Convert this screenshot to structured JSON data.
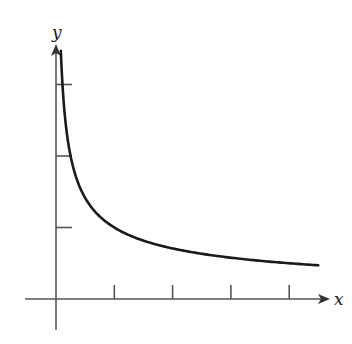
{
  "chart_data": {
    "type": "line",
    "title": "",
    "xlabel": "x",
    "ylabel": "y",
    "function": "y = 1/sqrt(x)",
    "series": [
      {
        "name": "curve",
        "x": [
          0.083,
          0.1,
          0.15,
          0.2,
          0.3,
          0.4,
          0.5,
          0.75,
          1,
          1.5,
          2,
          2.5,
          3,
          3.5,
          4,
          4.5
        ],
        "y": [
          3.46,
          3.16,
          2.58,
          2.24,
          1.83,
          1.58,
          1.41,
          1.15,
          1.0,
          0.82,
          0.71,
          0.63,
          0.58,
          0.53,
          0.5,
          0.47
        ]
      }
    ],
    "x_ticks": [
      1,
      2,
      3,
      4
    ],
    "y_ticks": [
      1,
      2,
      3
    ],
    "tick_labels_shown": false,
    "xlim": [
      -0.55,
      4.7
    ],
    "ylim": [
      -0.45,
      3.55
    ],
    "grid": false,
    "legend": false
  },
  "colors": {
    "axis": "#555555",
    "curve": "#1a1a1a",
    "background": "#ffffff"
  }
}
